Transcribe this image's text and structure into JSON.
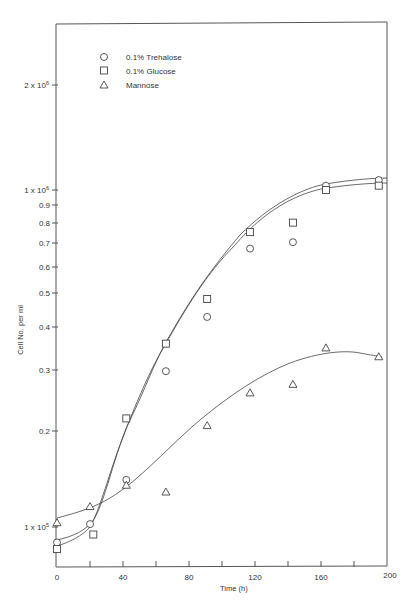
{
  "chart_data": {
    "type": "scatter",
    "title": "",
    "xlabel": "Time (h)",
    "ylabel": "Cell No. per ml",
    "xlim": [
      0,
      200
    ],
    "ylim_log": [
      100000,
      2000000
    ],
    "yscale": "log",
    "grid": false,
    "legend_position": "top-left-inside",
    "x_ticks": [
      0,
      40,
      80,
      120,
      160,
      200
    ],
    "x_minor_ticks": [
      20,
      60,
      100,
      140,
      180
    ],
    "y_ticks": [
      {
        "value": 2000000,
        "label": "2 x 10^6"
      },
      {
        "value": 1000000,
        "label": "1 x 10^6"
      },
      {
        "value": 900000,
        "label": "0.9"
      },
      {
        "value": 800000,
        "label": "0.8"
      },
      {
        "value": 700000,
        "label": "0.7"
      },
      {
        "value": 600000,
        "label": "0.6"
      },
      {
        "value": 500000,
        "label": "0.5"
      },
      {
        "value": 400000,
        "label": "0.4"
      },
      {
        "value": 300000,
        "label": "0.3"
      },
      {
        "value": 200000,
        "label": "0.2"
      },
      {
        "value": 100000,
        "label": "1 x 10^5"
      }
    ],
    "series": [
      {
        "name": "0.1% Trehalose",
        "marker": "circle",
        "x": [
          0,
          20,
          42,
          66,
          91,
          117,
          143,
          163,
          195
        ],
        "values": [
          90000,
          102000,
          138000,
          290000,
          420000,
          670000,
          700000,
          1030000,
          1070000
        ]
      },
      {
        "name": "0.1% Glucose",
        "marker": "square",
        "x": [
          0,
          22,
          42,
          66,
          91,
          117,
          143,
          163,
          195
        ],
        "values": [
          86000,
          95000,
          210000,
          350000,
          475000,
          750000,
          800000,
          1000000,
          1030000
        ]
      },
      {
        "name": "Mannose",
        "marker": "triangle",
        "x": [
          0,
          20,
          42,
          66,
          91,
          117,
          143,
          163,
          195
        ],
        "values": [
          103000,
          115000,
          133000,
          127000,
          200000,
          250000,
          265000,
          340000,
          320000
        ]
      }
    ]
  },
  "axes": {
    "x_title": "Time (h)",
    "y_title": "Cell No. per ml",
    "x_labels": [
      "0",
      "40",
      "80",
      "120",
      "160",
      "200"
    ],
    "y_labels": {
      "two_million_pre": "2 x 10",
      "two_million_exp": "6",
      "one_million_pre": "1 x 10",
      "one_million_exp": "6",
      "d09": "0.9",
      "d08": "0.8",
      "d07": "0.7",
      "d06": "0.6",
      "d05": "0.5",
      "d04": "0.4",
      "d03": "0.3",
      "d02": "0.2",
      "hundred_k_pre": "1 x 10",
      "hundred_k_exp": "5"
    }
  },
  "legend": {
    "items": [
      {
        "label": "0.1% Trehalose",
        "marker": "circle"
      },
      {
        "label": "0.1% Glucose",
        "marker": "square"
      },
      {
        "label": "Mannose",
        "marker": "triangle"
      }
    ]
  },
  "colors": {
    "ink": "#444444",
    "background": "#ffffff"
  }
}
